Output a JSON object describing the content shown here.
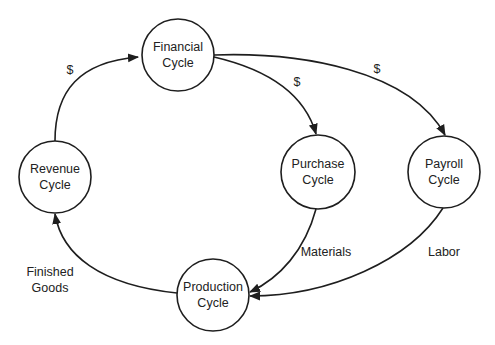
{
  "diagram": {
    "type": "cycle-flow",
    "colors": {
      "stroke": "#1e1e1e",
      "text": "#222222",
      "background": "#ffffff"
    },
    "nodes": [
      {
        "id": "financial",
        "line1": "Financial",
        "line2": "Cycle",
        "cx": 178,
        "cy": 55,
        "r": 36
      },
      {
        "id": "revenue",
        "line1": "Revenue",
        "line2": "Cycle",
        "cx": 55,
        "cy": 177,
        "r": 36
      },
      {
        "id": "purchase",
        "line1": "Purchase",
        "line2": "Cycle",
        "cx": 318,
        "cy": 172,
        "r": 37
      },
      {
        "id": "payroll",
        "line1": "Payroll",
        "line2": "Cycle",
        "cx": 444,
        "cy": 172,
        "r": 36
      },
      {
        "id": "production",
        "line1": "Production",
        "line2": "Cycle",
        "cx": 213,
        "cy": 295,
        "r": 36
      }
    ],
    "edges": [
      {
        "id": "revenue-to-financial",
        "from": "revenue",
        "to": "financial",
        "label": "$"
      },
      {
        "id": "financial-to-purchase",
        "from": "financial",
        "to": "purchase",
        "label": "$"
      },
      {
        "id": "financial-to-payroll",
        "from": "financial",
        "to": "payroll",
        "label": "$"
      },
      {
        "id": "purchase-to-production",
        "from": "purchase",
        "to": "production",
        "label": "Materials"
      },
      {
        "id": "payroll-to-production",
        "from": "payroll",
        "to": "production",
        "label": "Labor"
      },
      {
        "id": "production-to-revenue",
        "from": "production",
        "to": "revenue",
        "label_line1": "Finished",
        "label_line2": "Goods"
      }
    ]
  }
}
